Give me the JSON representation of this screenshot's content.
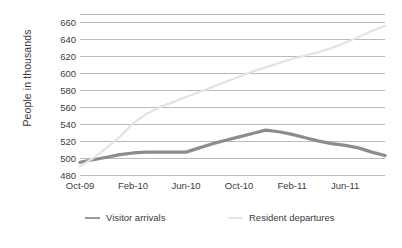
{
  "chart_data": {
    "type": "line",
    "title": "",
    "subtitle": "",
    "xlabel": "",
    "ylabel": "People in thousands",
    "ylim": [
      480,
      670
    ],
    "y_ticks": [
      480,
      500,
      520,
      540,
      560,
      580,
      600,
      620,
      640,
      660
    ],
    "grid": true,
    "grid_axis": "y",
    "legend_position": "bottom",
    "x_tick_labels": [
      "Oct-09",
      "Feb-10",
      "Jun-10",
      "Oct-10",
      "Feb-11",
      "Jun-11"
    ],
    "x_tick_indices": [
      0,
      4,
      8,
      12,
      16,
      20
    ],
    "x": [
      "Oct-09",
      "Nov-09",
      "Dec-09",
      "Jan-10",
      "Feb-10",
      "Mar-10",
      "Apr-10",
      "May-10",
      "Jun-10",
      "Jul-10",
      "Aug-10",
      "Sep-10",
      "Oct-10",
      "Nov-10",
      "Dec-10",
      "Jan-11",
      "Feb-11",
      "Mar-11",
      "Apr-11",
      "May-11",
      "Jun-11",
      "Jul-11",
      "Aug-11",
      "Sep-11"
    ],
    "series": [
      {
        "name": "Visitor arrivals",
        "color": "#8c8c8c",
        "width": 3.2,
        "values": [
          495,
          498,
          501,
          504,
          506,
          507,
          507,
          507,
          507,
          512,
          517,
          521,
          525,
          529,
          533,
          531,
          528,
          524,
          520,
          517,
          515,
          512,
          507,
          503
        ]
      },
      {
        "name": "Resident departures",
        "color": "#e3e3e3",
        "width": 2.2,
        "values": [
          490,
          500,
          512,
          525,
          541,
          552,
          560,
          566,
          572,
          578,
          584,
          590,
          596,
          602,
          607,
          612,
          617,
          621,
          625,
          630,
          636,
          643,
          650,
          656
        ]
      }
    ]
  },
  "legend": {
    "items": [
      {
        "label": "Visitor arrivals",
        "color": "#9a9a9a"
      },
      {
        "label": "Resident departures",
        "color": "#e6e6e6"
      }
    ]
  },
  "axes": {
    "y_title": "People in thousands"
  }
}
